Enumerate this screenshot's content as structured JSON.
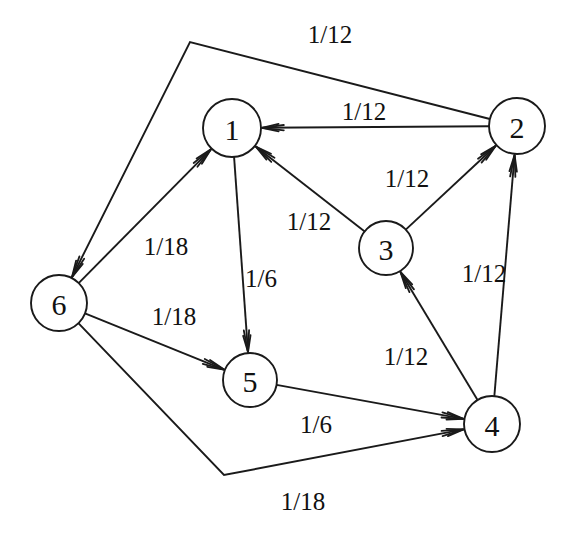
{
  "figure": {
    "name": "directed-weighted-graph",
    "background_color": "#ffffff",
    "stroke_color": "#1a1a1a",
    "text_color": "#111111",
    "width": 567,
    "height": 534
  },
  "chart_data": {
    "type": "diagram",
    "diagram_kind": "directed weighted graph",
    "title": "",
    "nodes": [
      {
        "id": "1",
        "label": "1",
        "x": 232,
        "y": 128,
        "r": 29
      },
      {
        "id": "2",
        "label": "2",
        "x": 517,
        "y": 126,
        "r": 28
      },
      {
        "id": "3",
        "label": "3",
        "x": 386,
        "y": 248,
        "r": 27
      },
      {
        "id": "4",
        "label": "4",
        "x": 492,
        "y": 424,
        "r": 28
      },
      {
        "id": "5",
        "label": "5",
        "x": 250,
        "y": 380,
        "r": 27
      },
      {
        "id": "6",
        "label": "6",
        "x": 59,
        "y": 303,
        "r": 28
      }
    ],
    "edges": [
      {
        "from": "2",
        "to": "6",
        "weight": "1/12",
        "label_x": 330,
        "label_y": 34,
        "bend": [
          190,
          42
        ]
      },
      {
        "from": "2",
        "to": "1",
        "weight": "1/12",
        "label_x": 364,
        "label_y": 111
      },
      {
        "from": "3",
        "to": "2",
        "weight": "1/12",
        "label_x": 407,
        "label_y": 178
      },
      {
        "from": "3",
        "to": "1",
        "weight": "1/12",
        "label_x": 309,
        "label_y": 221
      },
      {
        "from": "6",
        "to": "1",
        "weight": "1/18",
        "label_x": 166,
        "label_y": 246
      },
      {
        "from": "1",
        "to": "5",
        "weight": "1/6",
        "label_x": 261,
        "label_y": 278
      },
      {
        "from": "6",
        "to": "5",
        "weight": "1/18",
        "label_x": 174,
        "label_y": 316
      },
      {
        "from": "4",
        "to": "2",
        "weight": "1/12",
        "label_x": 484,
        "label_y": 273
      },
      {
        "from": "4",
        "to": "3",
        "weight": "1/12",
        "label_x": 406,
        "label_y": 356
      },
      {
        "from": "5",
        "to": "4",
        "weight": "1/6",
        "label_x": 316,
        "label_y": 424
      },
      {
        "from": "6",
        "to": "4",
        "weight": "1/18",
        "label_x": 303,
        "label_y": 501,
        "bend": [
          224,
          475
        ]
      }
    ]
  }
}
